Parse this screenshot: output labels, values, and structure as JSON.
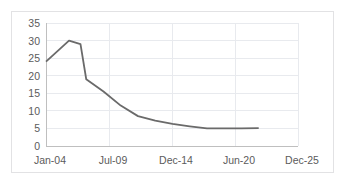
{
  "chart_data": {
    "type": "line",
    "title": "",
    "subtitle": "",
    "xlabel": "",
    "ylabel": "",
    "grid": true,
    "legend": false,
    "legend_position": "none",
    "line_color": "#6a6a6a",
    "axis_text_color": "#5b5b5b",
    "gridline_color": "#e8eaee",
    "border_color": "#e2e2e4",
    "ylim": [
      0,
      35
    ],
    "yticks": [
      0,
      5,
      10,
      15,
      20,
      25,
      30,
      35
    ],
    "ytick_labels": [
      "0",
      "5",
      "10",
      "15",
      "20",
      "25",
      "30",
      "35"
    ],
    "xtick_labels": [
      "Jan-04",
      "Jul-09",
      "Dec-14",
      "Jun-20",
      "Dec-25"
    ],
    "xlim_labels": [
      "Jan-04",
      "Dec-25"
    ],
    "series": [
      {
        "name": "series-1",
        "x": [
          "Jan-04",
          "Jan-05",
          "Jan-06",
          "Jan-07",
          "Jul-07",
          "Jan-09",
          "Jul-10",
          "Jan-12",
          "Jul-13",
          "Jan-15",
          "Jul-16",
          "Jan-18",
          "Jul-19",
          "Jan-21",
          "Jul-22"
        ],
        "values": [
          24,
          27,
          30,
          29,
          19,
          15.5,
          11.5,
          8.5,
          7.2,
          6.3,
          5.6,
          5.0,
          5.0,
          5.0,
          5.1
        ]
      }
    ]
  }
}
